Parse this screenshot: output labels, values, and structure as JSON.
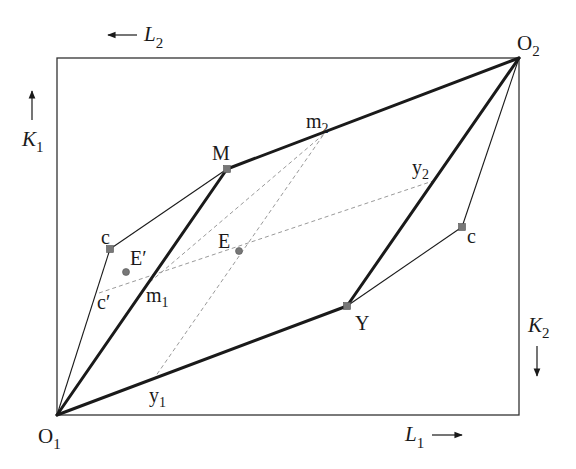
{
  "diagram": {
    "type": "Edgeworth box with production points",
    "box": {
      "x1": 57,
      "y1": 58,
      "x2": 519,
      "y2": 415,
      "stroke": "#333333"
    },
    "origins": {
      "O1": {
        "label": "O",
        "sub": "1",
        "x": 57,
        "y": 415
      },
      "O2": {
        "label": "O",
        "sub": "2",
        "x": 519,
        "y": 58
      }
    },
    "axis_labels": {
      "L2": {
        "label": "L",
        "sub": "2",
        "arrow": "left"
      },
      "K1": {
        "label": "K",
        "sub": "1",
        "arrow": "up"
      },
      "K2": {
        "label": "K",
        "sub": "2",
        "arrow": "down"
      },
      "L1": {
        "label": "L",
        "sub": "1",
        "arrow": "right"
      }
    },
    "points": {
      "M": {
        "label": "M",
        "x": 227,
        "y": 169
      },
      "Y": {
        "label": "Y",
        "x": 347,
        "y": 306
      },
      "E": {
        "label": "E",
        "x": 239,
        "y": 251
      },
      "E_prime": {
        "label": "E′",
        "x": 126,
        "y": 272
      },
      "c_left": {
        "label": "c",
        "x": 110,
        "y": 249
      },
      "c_right": {
        "label": "c",
        "x": 462,
        "y": 227
      },
      "c_prime": {
        "label": "c′",
        "x": 99,
        "y": 293
      },
      "m1": {
        "label": "m",
        "sub": "1",
        "x": 150,
        "y": 282
      },
      "m2": {
        "label": "m",
        "sub": "2",
        "x": 324,
        "y": 134
      },
      "y1": {
        "label": "y",
        "sub": "1",
        "x": 153,
        "y": 380
      },
      "y2": {
        "label": "y",
        "sub": "2",
        "x": 433,
        "y": 181
      }
    },
    "thick_lines": [
      [
        "O1",
        "M"
      ],
      [
        "M",
        "O2"
      ],
      [
        "O1",
        "Y"
      ],
      [
        "Y",
        "O2"
      ]
    ],
    "thin_lines": [
      [
        "O1",
        "c_left"
      ],
      [
        "c_left",
        "M"
      ],
      [
        "Y",
        "c_right"
      ],
      [
        "c_right",
        "O2"
      ]
    ],
    "dashed_lines": [
      [
        "m1",
        "m2"
      ],
      [
        "y1",
        "m2"
      ],
      [
        "c_prime",
        "y2"
      ]
    ],
    "colors": {
      "line": "#1a1a1a",
      "dashed": "#999999",
      "point_fill": "#777777"
    }
  }
}
